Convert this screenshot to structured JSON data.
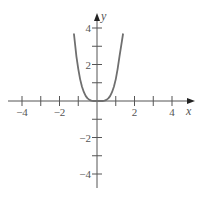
{
  "chart_data": {
    "type": "line",
    "title": "",
    "xlabel": "x",
    "ylabel": "y",
    "xlim": [
      -4.8,
      5
    ],
    "ylim": [
      -4.7,
      4.8
    ],
    "xticks": [
      -4,
      -3,
      -2,
      -1,
      1,
      2,
      3,
      4
    ],
    "xtick_labels": [
      {
        "value": -4,
        "label": "−4"
      },
      {
        "value": -2,
        "label": "−2"
      },
      {
        "value": 2,
        "label": "2"
      },
      {
        "value": 4,
        "label": "4"
      }
    ],
    "yticks": [
      -4,
      -3,
      -2,
      -1,
      1,
      2,
      3,
      4
    ],
    "ytick_labels": [
      {
        "value": 4,
        "label": "4"
      },
      {
        "value": 2,
        "label": "2"
      },
      {
        "value": -2,
        "label": "−2"
      },
      {
        "value": -4,
        "label": "−4"
      }
    ],
    "grid": false,
    "legend": null,
    "series": [
      {
        "name": "curve",
        "description": "U-shaped quartic-like curve, flat near origin",
        "x": [
          -1.23,
          -1.1,
          -1.0,
          -0.9,
          -0.8,
          -0.7,
          -0.6,
          -0.5,
          -0.4,
          -0.3,
          -0.2,
          -0.1,
          0.0,
          0.1,
          0.2,
          0.3,
          0.4,
          0.5,
          0.6,
          0.7,
          0.8,
          0.9,
          1.0,
          1.1,
          1.2,
          1.3,
          1.39
        ],
        "y": [
          3.7,
          2.45,
          1.75,
          1.2,
          0.78,
          0.48,
          0.27,
          0.14,
          0.06,
          0.02,
          0.0,
          0.0,
          0.0,
          0.0,
          0.0,
          0.0,
          0.02,
          0.06,
          0.14,
          0.27,
          0.48,
          0.78,
          1.2,
          1.75,
          2.45,
          3.1,
          3.7
        ]
      }
    ],
    "colors": {
      "curve": "#6f6f6f",
      "axes": "#555555"
    }
  }
}
